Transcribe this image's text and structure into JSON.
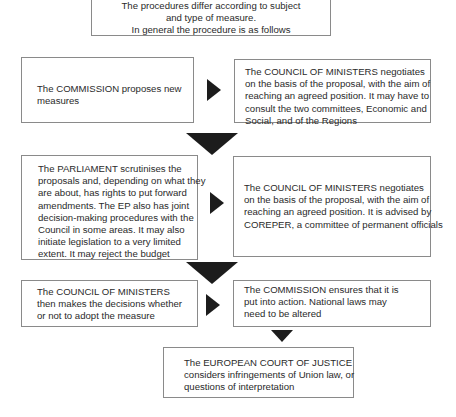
{
  "intro": {
    "lines": [
      "The procedures differ according to subject",
      "and type of measure.",
      "In general the procedure is as follows"
    ]
  },
  "steps": {
    "commission_proposes": {
      "lines": [
        "The COMMISSION proposes new",
        "measures"
      ]
    },
    "council_negotiates_1": {
      "lines": [
        "The COUNCIL OF MINISTERS negotiates",
        "on the basis of the proposal, with the aim of",
        "reaching an agreed position. It may have to",
        "consult the two committees, Economic and",
        "Social, and of the Regions"
      ]
    },
    "parliament_scrutinises": {
      "lines": [
        "The PARLIAMENT scrutinises the",
        "proposals and, depending on what they",
        "are about, has rights to put forward",
        "amendments. The EP also has joint",
        "decision-making procedures with the",
        "Council in some areas. It may also",
        "initiate legislation to a very limited",
        "extent. It may reject the budget"
      ]
    },
    "council_negotiates_2": {
      "lines": [
        "The COUNCIL OF MINISTERS negotiates",
        "on the basis of the proposal, with the aim of",
        "reaching an agreed position. It is advised by",
        "COREPER, a committee of permanent officials"
      ]
    },
    "council_decides": {
      "lines": [
        "The COUNCIL OF MINISTERS",
        "then makes the decisions whether",
        "or not to adopt the measure"
      ]
    },
    "commission_ensures": {
      "lines": [
        "The COMMISSION ensures that it is",
        "put into action. National laws may",
        "need to be altered"
      ]
    },
    "court_of_justice": {
      "lines": [
        "The EUROPEAN COURT OF JUSTICE",
        "considers infringements of Union law, or",
        "questions of interpretation"
      ]
    }
  },
  "arrows": [
    {
      "from": "commission_proposes",
      "to": "council_negotiates_1",
      "direction": "right"
    },
    {
      "from": "row1",
      "to": "row2",
      "direction": "down"
    },
    {
      "from": "parliament_scrutinises",
      "to": "council_negotiates_2",
      "direction": "right"
    },
    {
      "from": "row2",
      "to": "row3",
      "direction": "down"
    },
    {
      "from": "council_decides",
      "to": "commission_ensures",
      "direction": "right"
    },
    {
      "from": "commission_ensures",
      "to": "court_of_justice",
      "direction": "down"
    }
  ],
  "colors": {
    "border": "#8a8a8a",
    "arrow": "#1c1c1c",
    "text": "#2a2a2a"
  }
}
